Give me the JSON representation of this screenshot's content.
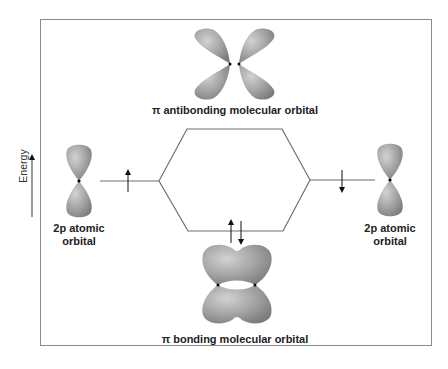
{
  "axis": {
    "label": "Energy",
    "direction": "up"
  },
  "labels": {
    "antibonding": "π antibonding molecular orbital",
    "bonding": "π bonding molecular orbital",
    "left_atomic_line1": "2p atomic",
    "left_atomic_line2": "orbital",
    "right_atomic_line1": "2p atomic",
    "right_atomic_line2": "orbital"
  },
  "electrons": {
    "left_atomic": "up",
    "right_atomic": "down",
    "bonding": [
      "up",
      "down"
    ],
    "antibonding": []
  },
  "colors": {
    "orbital_fill": "#9d9d9d",
    "orbital_highlight": "#cfcfcf",
    "line": "#6e6e6e",
    "frame": "#8a8a8a"
  }
}
